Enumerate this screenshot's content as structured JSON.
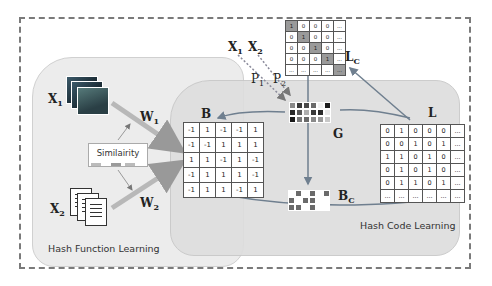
{
  "figure": {
    "regions": {
      "hash_function_learning": "Hash Function Learning",
      "hash_code_learning": "Hash Code Learning"
    },
    "modalities": {
      "x1": {
        "label": "X",
        "sub": "1",
        "kind": "image-stack"
      },
      "x2": {
        "label": "X",
        "sub": "2",
        "kind": "document-stack"
      }
    },
    "projections": {
      "w1": {
        "label": "W",
        "sub": "1"
      },
      "w2": {
        "label": "W",
        "sub": "2"
      },
      "p1": {
        "label": "P",
        "sub": "1"
      },
      "p2": {
        "label": "P",
        "sub": "2"
      }
    },
    "top_inputs": {
      "x1": {
        "label": "X",
        "sub": "1"
      },
      "x2": {
        "label": "X",
        "sub": "2"
      }
    },
    "similarity_box": {
      "label": "Similairity"
    },
    "matrices": {
      "B": {
        "label": "B",
        "rows": [
          [
            "-1",
            "1",
            "-1",
            "-1",
            "1"
          ],
          [
            "-1",
            "-1",
            "1",
            "1",
            "1"
          ],
          [
            "1",
            "1",
            "-1",
            "1",
            "-1"
          ],
          [
            "-1",
            "1",
            "1",
            "1",
            "-1"
          ],
          [
            "-1",
            "1",
            "1",
            "-1",
            "1"
          ]
        ]
      },
      "L": {
        "label": "L",
        "rows": [
          [
            "0",
            "1",
            "0",
            "0",
            "0",
            "..."
          ],
          [
            "0",
            "0",
            "1",
            "0",
            "1",
            "..."
          ],
          [
            "1",
            "1",
            "0",
            "1",
            "0",
            "..."
          ],
          [
            "0",
            "1",
            "0",
            "1",
            "0",
            "..."
          ],
          [
            "0",
            "1",
            "1",
            "0",
            "1",
            "..."
          ],
          [
            "...",
            "...",
            "...",
            "...",
            "...",
            "..."
          ]
        ]
      },
      "Lc": {
        "label": "L",
        "sub": "C",
        "rows": [
          [
            "1",
            "0",
            "0",
            "0",
            "..."
          ],
          [
            "0",
            "1",
            "0",
            "0",
            "..."
          ],
          [
            "0",
            "0",
            "1",
            "0",
            "..."
          ],
          [
            "0",
            "0",
            "0",
            "1",
            "..."
          ],
          [
            "...",
            "...",
            "...",
            "...",
            "..."
          ]
        ]
      },
      "G": {
        "label": "G",
        "cells": [
          [
            "#8a8a8a",
            "#3a3a3a",
            "#4a4a4a",
            "#6a6a6a",
            "#f2f2f2",
            "#1e1e1e"
          ],
          [
            "#2a2a2a",
            "#5a5a5a",
            "#b0b0b0",
            "#3a3a3a",
            "#2a2a2a",
            "#e8e8e8"
          ],
          [
            "#1a1a1a",
            "#7a7a7a",
            "#6a6a6a",
            "#8a8a8a",
            "#9a9a9a",
            "#c8c8c8"
          ]
        ]
      },
      "Bc": {
        "label": "B",
        "sub": "C",
        "cells": [
          [
            0,
            1,
            0,
            1,
            0,
            1
          ],
          [
            1,
            0,
            1,
            1,
            0,
            0
          ],
          [
            1,
            1,
            0,
            1,
            0,
            0
          ]
        ]
      }
    },
    "colors": {
      "arrow": "#6f7f8f",
      "dashed_arrow": "#8a8a9a",
      "w_arrow": "#b8b8b8",
      "frame": "#7a7a7a",
      "region_hf": "#ececec",
      "region_hc": "#dedede",
      "bc_dark": "#6a6a6a",
      "sim_bar": "#9a9a9a"
    }
  }
}
